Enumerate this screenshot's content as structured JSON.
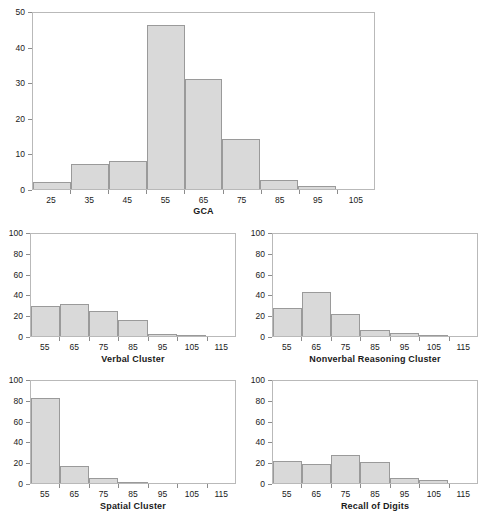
{
  "figure": {
    "type": "multi-panel-histogram-figure",
    "panel_count": 5,
    "bar_fill": "#d9d9d9",
    "bar_stroke": "#9a9a9a",
    "frame_color": "#b9b9b9"
  },
  "chart_data": [
    {
      "id": "gca",
      "type": "bar",
      "title": "",
      "xlabel": "GCA",
      "ylabel": "",
      "categories": [
        "25",
        "35",
        "45",
        "55",
        "65",
        "75",
        "85",
        "95",
        "105"
      ],
      "values": [
        2,
        7,
        8,
        46,
        31,
        14,
        2.5,
        0.8,
        0
      ],
      "xticks": [
        "25",
        "35",
        "45",
        "55",
        "65",
        "75",
        "85",
        "95",
        "105"
      ],
      "yticks": [
        "0",
        "10",
        "20",
        "30",
        "40",
        "50"
      ],
      "ylim": [
        0,
        50
      ],
      "grid": false,
      "legend": "none"
    },
    {
      "id": "verbal-cluster",
      "type": "bar",
      "title": "",
      "xlabel": "Verbal Cluster",
      "ylabel": "",
      "categories": [
        "55",
        "65",
        "75",
        "85",
        "95",
        "105",
        "115"
      ],
      "values": [
        29,
        31,
        24,
        15,
        2,
        0.5,
        0
      ],
      "xticks": [
        "55",
        "65",
        "75",
        "85",
        "95",
        "105",
        "115"
      ],
      "yticks": [
        "0",
        "20",
        "40",
        "60",
        "80",
        "100"
      ],
      "ylim": [
        0,
        100
      ],
      "grid": false,
      "legend": "none"
    },
    {
      "id": "nonverbal-reasoning-cluster",
      "type": "bar",
      "title": "",
      "xlabel": "Nonverbal Reasoning Cluster",
      "ylabel": "",
      "categories": [
        "55",
        "65",
        "75",
        "85",
        "95",
        "105",
        "115"
      ],
      "values": [
        27,
        42,
        21,
        6,
        3,
        0.3,
        0
      ],
      "xticks": [
        "55",
        "65",
        "75",
        "85",
        "95",
        "105",
        "115"
      ],
      "yticks": [
        "0",
        "20",
        "40",
        "60",
        "80",
        "100"
      ],
      "ylim": [
        0,
        100
      ],
      "grid": false,
      "legend": "none"
    },
    {
      "id": "spatial-cluster",
      "type": "bar",
      "title": "",
      "xlabel": "Spatial Cluster",
      "ylabel": "",
      "categories": [
        "55",
        "65",
        "75",
        "85",
        "95",
        "105",
        "115"
      ],
      "values": [
        82,
        16,
        5,
        1,
        0,
        0,
        0
      ],
      "xticks": [
        "55",
        "65",
        "75",
        "85",
        "95",
        "105",
        "115"
      ],
      "yticks": [
        "0",
        "20",
        "40",
        "60",
        "80",
        "100"
      ],
      "ylim": [
        0,
        100
      ],
      "grid": false,
      "legend": "none"
    },
    {
      "id": "recall-of-digits",
      "type": "bar",
      "title": "",
      "xlabel": "Recall of Digits",
      "ylabel": "",
      "categories": [
        "55",
        "65",
        "75",
        "85",
        "95",
        "105",
        "115"
      ],
      "values": [
        21,
        18,
        27,
        20,
        5,
        3,
        0
      ],
      "xticks": [
        "55",
        "65",
        "75",
        "85",
        "95",
        "105",
        "115"
      ],
      "yticks": [
        "0",
        "20",
        "40",
        "60",
        "80",
        "100"
      ],
      "ylim": [
        0,
        100
      ],
      "grid": false,
      "legend": "none"
    }
  ]
}
